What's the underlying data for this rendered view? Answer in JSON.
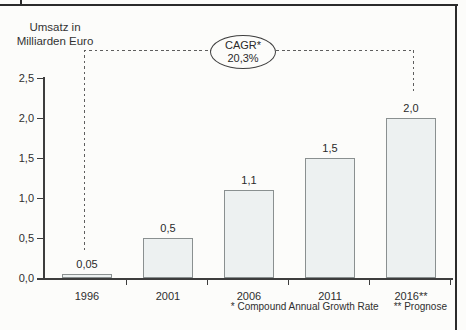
{
  "chart_data": {
    "type": "bar",
    "title": "",
    "ylabel_lines": [
      "Umsatz in",
      "Milliarden Euro"
    ],
    "categories": [
      "1996",
      "2001",
      "2006",
      "2011",
      "2016**"
    ],
    "values": [
      0.05,
      0.5,
      1.1,
      1.5,
      2.0
    ],
    "value_labels": [
      "0,05",
      "0,5",
      "1,1",
      "1,5",
      "2,0"
    ],
    "y_tick_labels": [
      "2,5",
      "2,0",
      "1,5",
      "1,0",
      "0,5",
      "0,0"
    ],
    "ylim": [
      0,
      2.5
    ],
    "grid": false,
    "legend": false,
    "bar_color": "#edf1f1",
    "bar_border_color": "#8a9090",
    "annotation": {
      "line1": "CAGR*",
      "line2": "20,3%"
    },
    "footnotes": [
      "* Compound Annual Growth Rate",
      "** Prognose"
    ]
  }
}
